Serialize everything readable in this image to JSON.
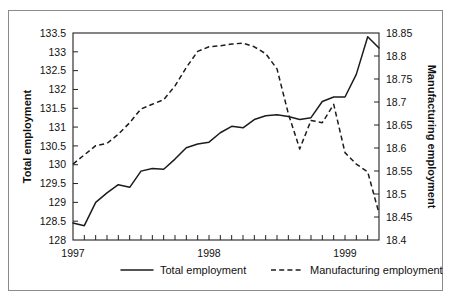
{
  "chart_data": {
    "type": "line",
    "title": "",
    "xlabel": "",
    "ylabel": "Total employment",
    "y2label": "Manufacturing employment",
    "grid": false,
    "legend_position": "bottom",
    "xlim": [
      1997.0,
      1999.25
    ],
    "xtick_labels": [
      "1997",
      "1998",
      "1999"
    ],
    "xtick_values": [
      1997,
      1998,
      1999
    ],
    "x_minor_tick_interval_months": 1,
    "ylim": [
      128,
      133.5
    ],
    "ytick_labels": [
      "128",
      "128.5",
      "129",
      "129.5",
      "130",
      "130.5",
      "131",
      "131.5",
      "132",
      "132.5",
      "133",
      "133.5"
    ],
    "ytick_values": [
      128,
      128.5,
      129,
      129.5,
      130,
      130.5,
      131,
      131.5,
      132,
      132.5,
      133,
      133.5
    ],
    "y2lim": [
      18.4,
      18.85
    ],
    "y2tick_labels": [
      "18.4",
      "18.45",
      "18.5",
      "18.55",
      "18.6",
      "18.65",
      "18.7",
      "18.75",
      "18.8",
      "18.85"
    ],
    "y2tick_values": [
      18.4,
      18.45,
      18.5,
      18.55,
      18.6,
      18.65,
      18.7,
      18.75,
      18.8,
      18.85
    ],
    "x": [
      1997.0,
      1997.083,
      1997.167,
      1997.25,
      1997.333,
      1997.417,
      1997.5,
      1997.583,
      1997.667,
      1997.75,
      1997.833,
      1997.917,
      1998.0,
      1998.083,
      1998.167,
      1998.25,
      1998.333,
      1998.417,
      1998.5,
      1998.583,
      1998.667,
      1998.75,
      1998.833,
      1998.917,
      1999.0,
      1999.083,
      1999.167,
      1999.25
    ],
    "series": [
      {
        "name": "Total employment",
        "axis": "left",
        "style": "solid",
        "values": [
          128.45,
          128.38,
          129.0,
          129.25,
          129.47,
          129.4,
          129.83,
          129.9,
          129.88,
          130.15,
          130.45,
          130.55,
          130.6,
          130.85,
          131.02,
          130.98,
          131.2,
          131.3,
          131.33,
          131.28,
          131.2,
          131.25,
          131.68,
          131.8,
          131.8,
          132.4,
          133.4,
          133.1
        ]
      },
      {
        "name": "Manufacturing employment",
        "axis": "right",
        "style": "dashed",
        "values": [
          18.565,
          18.585,
          18.605,
          18.61,
          18.63,
          18.655,
          18.685,
          18.695,
          18.705,
          18.735,
          18.775,
          18.81,
          18.82,
          18.822,
          18.826,
          18.828,
          18.82,
          18.805,
          18.772,
          18.675,
          18.598,
          18.66,
          18.655,
          18.695,
          18.59,
          18.565,
          18.548,
          18.458
        ]
      }
    ],
    "legend": [
      {
        "label": "Total employment",
        "style": "solid"
      },
      {
        "label": "Manufacturing employment",
        "style": "dashed"
      }
    ]
  }
}
